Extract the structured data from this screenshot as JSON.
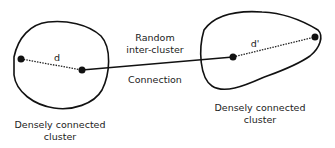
{
  "diagram": {
    "clusters": [
      {
        "id": "left",
        "caption_line1": "Densely connected",
        "caption_line2": "cluster",
        "distance_label": "d"
      },
      {
        "id": "right",
        "caption_line1": "Densely connected",
        "caption_line2": "cluster",
        "distance_label": "d'"
      }
    ],
    "connection": {
      "line1": "Random",
      "line2": "inter-cluster",
      "line3": "Connection"
    },
    "colors": {
      "stroke": "#111111",
      "text": "#222222",
      "background": "#ffffff"
    }
  }
}
